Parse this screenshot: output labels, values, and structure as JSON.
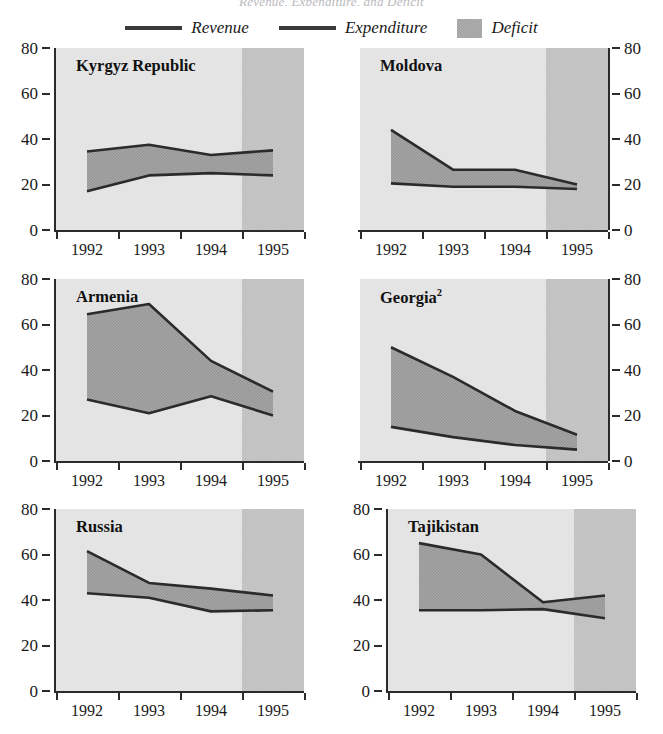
{
  "figure": {
    "cut_off_title": "Revenue, Expenditure, and Deficit",
    "legend": [
      {
        "key": "revenue",
        "label": "Revenue",
        "marker": "line",
        "color": "#3a3a3a"
      },
      {
        "key": "expenditure",
        "label": "Expenditure",
        "marker": "line",
        "color": "#3a3a3a"
      },
      {
        "key": "deficit",
        "label": "Deficit",
        "marker": "swatch",
        "color": "#b0b0b0"
      }
    ],
    "colors": {
      "plot_background": "#e4e4e4",
      "forecast_background": "#c7c7c7",
      "deficit_fill": "#a8a8a8",
      "line": "#2b2b2b",
      "axis": "#2b2b2b",
      "text": "#1a1a1a"
    }
  },
  "chart_data": [
    {
      "type": "area",
      "title": "Kyrgyz Republic",
      "title_superscript": "",
      "xlabel": "",
      "ylabel": "",
      "categories": [
        "1992",
        "1993",
        "1994",
        "1995"
      ],
      "x": [
        1992,
        1993,
        1994,
        1995
      ],
      "ylim": [
        0,
        80
      ],
      "yticks": [
        0,
        20,
        40,
        60,
        80
      ],
      "grid": false,
      "axis_side": "left",
      "forecast_from": "1995",
      "legend_position": "top-center-shared",
      "series": [
        {
          "name": "Revenue",
          "values": [
            17.0,
            24.0,
            25.0,
            24.0
          ]
        },
        {
          "name": "Expenditure",
          "values": [
            34.5,
            37.5,
            33.0,
            35.0
          ]
        }
      ],
      "band": {
        "name": "Deficit",
        "between": [
          "Revenue",
          "Expenditure"
        ]
      }
    },
    {
      "type": "area",
      "title": "Moldova",
      "title_superscript": "",
      "xlabel": "",
      "ylabel": "",
      "categories": [
        "1992",
        "1993",
        "1994",
        "1995"
      ],
      "x": [
        1992,
        1993,
        1994,
        1995
      ],
      "ylim": [
        0,
        80
      ],
      "yticks": [
        0,
        20,
        40,
        60,
        80
      ],
      "grid": false,
      "axis_side": "right",
      "forecast_from": "1995",
      "legend_position": "top-center-shared",
      "series": [
        {
          "name": "Revenue",
          "values": [
            20.5,
            19.0,
            19.0,
            18.0
          ]
        },
        {
          "name": "Expenditure",
          "values": [
            44.0,
            26.5,
            26.5,
            20.0
          ]
        }
      ],
      "band": {
        "name": "Deficit",
        "between": [
          "Revenue",
          "Expenditure"
        ]
      }
    },
    {
      "type": "area",
      "title": "Armenia",
      "title_superscript": "",
      "xlabel": "",
      "ylabel": "",
      "categories": [
        "1992",
        "1993",
        "1994",
        "1995"
      ],
      "x": [
        1992,
        1993,
        1994,
        1995
      ],
      "ylim": [
        0,
        80
      ],
      "yticks": [
        0,
        20,
        40,
        60,
        80
      ],
      "grid": false,
      "axis_side": "left",
      "forecast_from": "1995",
      "legend_position": "top-center-shared",
      "series": [
        {
          "name": "Revenue",
          "values": [
            27.0,
            21.0,
            28.5,
            20.0
          ]
        },
        {
          "name": "Expenditure",
          "values": [
            64.5,
            69.0,
            44.0,
            30.5
          ]
        }
      ],
      "band": {
        "name": "Deficit",
        "between": [
          "Revenue",
          "Expenditure"
        ]
      }
    },
    {
      "type": "area",
      "title": "Georgia",
      "title_superscript": "2",
      "xlabel": "",
      "ylabel": "",
      "categories": [
        "1992",
        "1993",
        "1994",
        "1995"
      ],
      "x": [
        1992,
        1993,
        1994,
        1995
      ],
      "ylim": [
        0,
        80
      ],
      "yticks": [
        0,
        20,
        40,
        60,
        80
      ],
      "grid": false,
      "axis_side": "right",
      "forecast_from": "1995",
      "legend_position": "top-center-shared",
      "series": [
        {
          "name": "Revenue",
          "values": [
            15.0,
            10.5,
            7.0,
            5.0
          ]
        },
        {
          "name": "Expenditure",
          "values": [
            50.0,
            37.0,
            22.0,
            11.5
          ]
        }
      ],
      "band": {
        "name": "Deficit",
        "between": [
          "Revenue",
          "Expenditure"
        ]
      }
    },
    {
      "type": "area",
      "title": "Russia",
      "title_superscript": "",
      "xlabel": "",
      "ylabel": "",
      "categories": [
        "1992",
        "1993",
        "1994",
        "1995"
      ],
      "x": [
        1992,
        1993,
        1994,
        1995
      ],
      "ylim": [
        0,
        80
      ],
      "yticks": [
        0,
        20,
        40,
        60,
        80
      ],
      "grid": false,
      "axis_side": "left",
      "forecast_from": "1995",
      "legend_position": "top-center-shared",
      "series": [
        {
          "name": "Revenue",
          "values": [
            43.0,
            41.0,
            35.0,
            35.5
          ]
        },
        {
          "name": "Expenditure",
          "values": [
            61.5,
            47.5,
            45.0,
            42.0
          ]
        }
      ],
      "band": {
        "name": "Deficit",
        "between": [
          "Revenue",
          "Expenditure"
        ]
      }
    },
    {
      "type": "area",
      "title": "Tajikistan",
      "title_superscript": "",
      "xlabel": "",
      "ylabel": "",
      "categories": [
        "1992",
        "1993",
        "1994",
        "1995"
      ],
      "x": [
        1992,
        1993,
        1994,
        1995
      ],
      "ylim": [
        0,
        80
      ],
      "yticks": [
        0,
        20,
        40,
        60,
        80
      ],
      "grid": false,
      "axis_side": "left",
      "forecast_from": "1995",
      "legend_position": "top-center-shared",
      "series": [
        {
          "name": "Revenue",
          "values": [
            35.5,
            35.5,
            36.0,
            32.0
          ]
        },
        {
          "name": "Expenditure",
          "values": [
            65.0,
            60.0,
            39.0,
            42.0
          ]
        }
      ],
      "band": {
        "name": "Deficit",
        "between": [
          "Revenue",
          "Expenditure"
        ]
      }
    }
  ]
}
